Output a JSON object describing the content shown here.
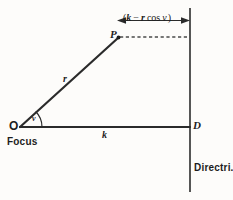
{
  "figure": {
    "background_color": "#fdfcfa",
    "ink_color": "#2b2b2b"
  },
  "labels": {
    "point_P": "P",
    "point_O": "O",
    "point_D": "D",
    "segment_r": "r",
    "segment_k": "k",
    "angle_v": "v",
    "focus": "Focus",
    "directrix": "Directri."
  },
  "dimension": {
    "open_paren": "(",
    "k_term": "k",
    "minus": "−",
    "r_term": "r",
    "cos": "cos",
    "angle": "v",
    "close_paren": ")",
    "full_text": "(k − r cos v)"
  },
  "geometry": {
    "focus_point": {
      "x": 20,
      "y": 127
    },
    "point_p": {
      "x": 118,
      "y": 38
    },
    "point_d": {
      "x": 190,
      "y": 127
    },
    "directrix_x": 190,
    "directrix_top_y": 8,
    "directrix_bottom_y": 192,
    "dimension_line_y": 20,
    "dimension_left_x": 118,
    "dimension_right_x": 190,
    "angle_arc_radius": 20
  }
}
